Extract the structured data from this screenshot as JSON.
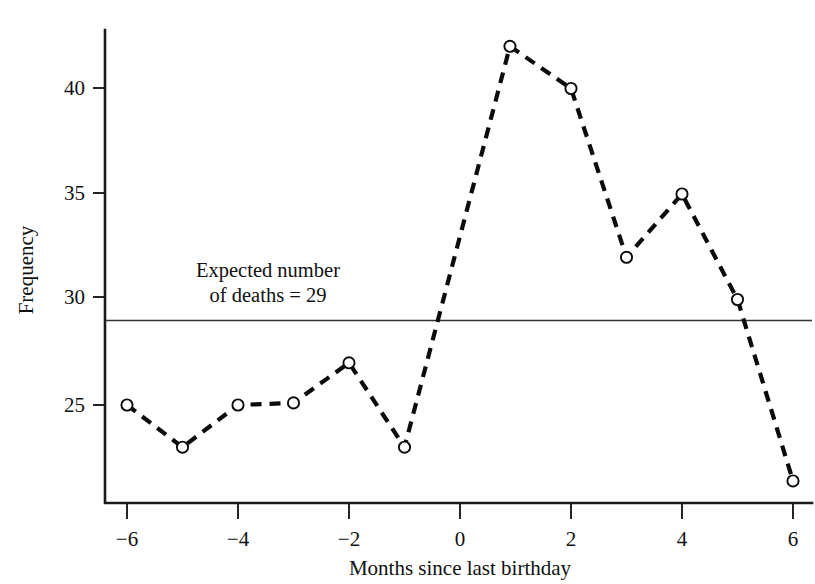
{
  "chart_data": {
    "type": "line",
    "title": "",
    "xlabel": "Months since last birthday",
    "ylabel": "Frequency",
    "x": [
      -6,
      -5,
      -4,
      -3,
      -2,
      -1,
      0.9,
      2,
      3,
      4,
      5,
      6
    ],
    "values": [
      25,
      23,
      25,
      25.1,
      27,
      23,
      42,
      40,
      32,
      35,
      30,
      21.4
    ],
    "series": [
      {
        "name": "Frequency of deaths",
        "x": [
          -6,
          -5,
          -4,
          -3,
          -2,
          -1,
          0.9,
          2,
          3,
          4,
          5,
          6
        ],
        "values": [
          25,
          23,
          25,
          25.1,
          27,
          23,
          42,
          40,
          32,
          35,
          30,
          21.4
        ]
      }
    ],
    "xlim": [
      -6.9,
      6.4
    ],
    "ylim": [
      20.4,
      43.2
    ],
    "xticks": [
      -6,
      -4,
      -2,
      0,
      2,
      4,
      6
    ],
    "xtick_labels": [
      "−6",
      "−4",
      "−2",
      "0",
      "2",
      "4",
      "6"
    ],
    "yticks": [
      25,
      30,
      35,
      40
    ],
    "ytick_labels": [
      "25",
      "30",
      "35",
      "40"
    ],
    "grid": false,
    "legend": "none",
    "marker": "open-circle",
    "line_style": "dashed",
    "line_color": "#0b0b0b",
    "reference_line": {
      "value": 29,
      "label_line_1": "Expected number",
      "label_line_2": "of deaths = 29",
      "color": "#333333"
    },
    "annotations": [
      {
        "text_line_1": "Expected number",
        "text_line_2": "of deaths = 29",
        "x": -1.95,
        "y": 32.6
      }
    ]
  }
}
